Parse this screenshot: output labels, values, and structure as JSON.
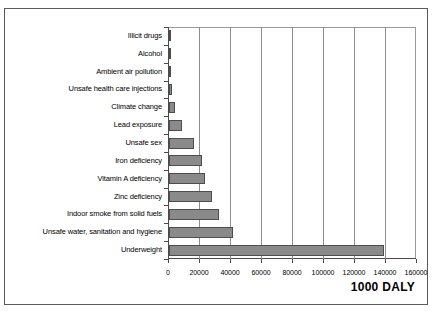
{
  "top_bleed_text": "",
  "caption": {
    "unit_label": "1000 DALY"
  },
  "chart_data": {
    "type": "bar",
    "orientation": "horizontal",
    "title": "",
    "subtitle": "",
    "xlabel": "1000 DALY",
    "ylabel": "",
    "categories": [
      "Illicit drugs",
      "Alcohol",
      "Ambient air pollution",
      "Unsafe health care injections",
      "Climate change",
      "Lead exposure",
      "Unsafe sex",
      "Iron deficiency",
      "Vitamin A deficiency",
      "Zinc deficiency",
      "Indoor smoke from solid fuels",
      "Unsafe water, sanitation and hygiene",
      "Underweight"
    ],
    "values": [
      200,
      300,
      900,
      1700,
      4000,
      8600,
      16000,
      21000,
      23000,
      28000,
      32000,
      41000,
      139000
    ],
    "xlim": [
      0,
      160000
    ],
    "xticks": [
      0,
      20000,
      40000,
      60000,
      80000,
      100000,
      120000,
      140000,
      160000
    ],
    "xtick_labels": [
      "0",
      "20000",
      "40000",
      "60000",
      "80000",
      "100000",
      "120000",
      "140000",
      "160000"
    ],
    "grid": true,
    "grid_axis": "x",
    "legend": false,
    "bar_fill_color": "#8a8a8a",
    "bar_edge_color": "#4d4d4d",
    "axis_color": "#4a4a4a",
    "grid_color": "#8d8d8d",
    "background_color": "#ffffff"
  }
}
